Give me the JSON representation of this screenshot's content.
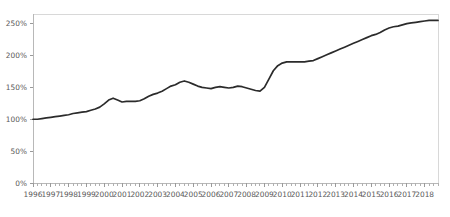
{
  "chart_data": {
    "type": "line",
    "title": "",
    "subtitle": "",
    "xlabel": "",
    "ylabel": "",
    "xlim": [
      1996,
      2018.75
    ],
    "ylim": [
      0,
      265
    ],
    "grid": false,
    "legend": false,
    "legend_position": "none",
    "y_ticks": [
      0,
      50,
      100,
      150,
      200,
      250
    ],
    "y_tick_labels": [
      "0%",
      "50%",
      "100%",
      "150%",
      "200%",
      "250%"
    ],
    "x_ticks": [
      1996,
      1997,
      1998,
      1999,
      2000,
      2001,
      2002,
      2003,
      2004,
      2005,
      2006,
      2007,
      2008,
      2009,
      2010,
      2011,
      2012,
      2013,
      2014,
      2015,
      2016,
      2017,
      2018
    ],
    "x_tick_labels": [
      "1996",
      "1997",
      "1998",
      "1999",
      "2000",
      "2001",
      "2002",
      "2003",
      "2004",
      "2005",
      "2006",
      "2007",
      "2008",
      "2009",
      "2010",
      "2011",
      "2012",
      "2013",
      "2014",
      "2015",
      "2016",
      "2017",
      "2018"
    ],
    "x_minor_step": 0.25,
    "series": [
      {
        "name": "Index",
        "color": "#2b2b2b",
        "x": [
          1996.0,
          1996.25,
          1996.5,
          1996.75,
          1997.0,
          1997.25,
          1997.5,
          1997.75,
          1998.0,
          1998.25,
          1998.5,
          1998.75,
          1999.0,
          1999.25,
          1999.5,
          1999.75,
          2000.0,
          2000.25,
          2000.5,
          2000.75,
          2001.0,
          2001.25,
          2001.5,
          2001.75,
          2002.0,
          2002.25,
          2002.5,
          2002.75,
          2003.0,
          2003.25,
          2003.5,
          2003.75,
          2004.0,
          2004.25,
          2004.5,
          2004.75,
          2005.0,
          2005.25,
          2005.5,
          2005.75,
          2006.0,
          2006.25,
          2006.5,
          2006.75,
          2007.0,
          2007.25,
          2007.5,
          2007.75,
          2008.0,
          2008.25,
          2008.5,
          2008.75,
          2009.0,
          2009.25,
          2009.5,
          2009.75,
          2010.0,
          2010.25,
          2010.5,
          2010.75,
          2011.0,
          2011.25,
          2011.5,
          2011.75,
          2012.0,
          2012.25,
          2012.5,
          2012.75,
          2013.0,
          2013.25,
          2013.5,
          2013.75,
          2014.0,
          2014.25,
          2014.5,
          2014.75,
          2015.0,
          2015.25,
          2015.5,
          2015.75,
          2016.0,
          2016.25,
          2016.5,
          2016.75,
          2017.0,
          2017.25,
          2017.5,
          2017.75,
          2018.0,
          2018.25,
          2018.5,
          2018.75
        ],
        "values": [
          100,
          100,
          101,
          102,
          103,
          104,
          105,
          106,
          107,
          109,
          110,
          111,
          112,
          114,
          116,
          119,
          124,
          130,
          133,
          130,
          127,
          128,
          128,
          128,
          129,
          132,
          136,
          139,
          141,
          144,
          148,
          152,
          154,
          158,
          160,
          158,
          155,
          152,
          150,
          149,
          148,
          150,
          151,
          150,
          149,
          150,
          152,
          151,
          149,
          147,
          145,
          144,
          150,
          163,
          176,
          184,
          188,
          190,
          190,
          190,
          190,
          190,
          191,
          192,
          195,
          198,
          201,
          204,
          207,
          210,
          213,
          216,
          219,
          222,
          225,
          228,
          231,
          233,
          236,
          240,
          243,
          245,
          246,
          248,
          250,
          251,
          252,
          253,
          254,
          255,
          255,
          255
        ]
      }
    ]
  },
  "plot": {
    "margin_left": 33,
    "margin_right": 12,
    "margin_top": 14,
    "margin_bottom": 34
  }
}
